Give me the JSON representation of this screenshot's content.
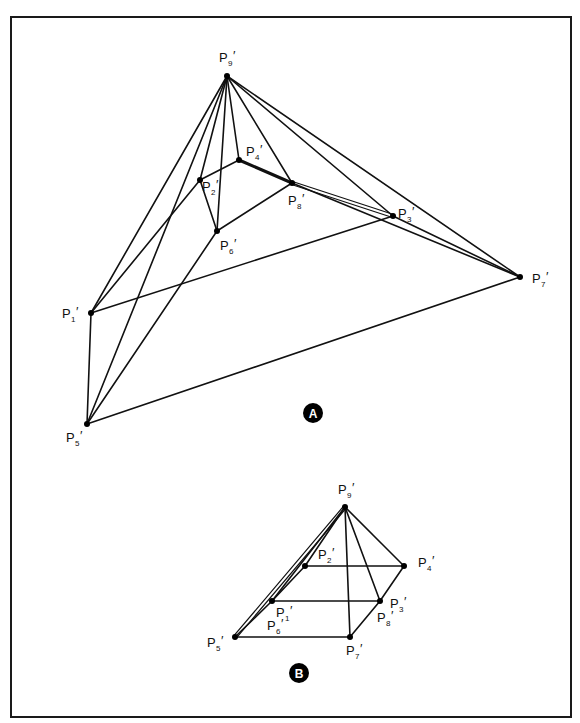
{
  "figure": {
    "frame": {
      "x": 11,
      "y": 17,
      "width": 560,
      "height": 700
    },
    "colors": {
      "line": "#111111",
      "vertex": "#000000",
      "badge": "#000000",
      "badge_text": "#ffffff",
      "background": "#ffffff"
    },
    "panels": [
      {
        "id": "A",
        "badge": {
          "label": "A",
          "x": 313,
          "y": 413,
          "r": 10
        },
        "points": [
          {
            "name": "P9",
            "label": "P",
            "sub": "9",
            "x": 227,
            "y": 76,
            "lx": 219,
            "ly": 62
          },
          {
            "name": "P4",
            "label": "P",
            "sub": "4",
            "x": 239,
            "y": 160,
            "lx": 246,
            "ly": 156
          },
          {
            "name": "P2",
            "label": "P",
            "sub": "2",
            "x": 200,
            "y": 180,
            "lx": 202,
            "ly": 191
          },
          {
            "name": "P8",
            "label": "P",
            "sub": "8",
            "x": 292,
            "y": 183,
            "lx": 288,
            "ly": 205
          },
          {
            "name": "P3",
            "label": "P",
            "sub": "3",
            "x": 393,
            "y": 216,
            "lx": 398,
            "ly": 218
          },
          {
            "name": "P6",
            "label": "P",
            "sub": "6",
            "x": 217,
            "y": 231,
            "lx": 220,
            "ly": 250
          },
          {
            "name": "P1",
            "label": "P",
            "sub": "1",
            "x": 91,
            "y": 313,
            "lx": 62,
            "ly": 318
          },
          {
            "name": "P5",
            "label": "P",
            "sub": "5",
            "x": 87,
            "y": 424,
            "lx": 66,
            "ly": 442
          },
          {
            "name": "P7",
            "label": "P",
            "sub": "7",
            "x": 520,
            "y": 277,
            "lx": 532,
            "ly": 283
          }
        ],
        "edges": [
          [
            "P9",
            "P1"
          ],
          [
            "P9",
            "P5"
          ],
          [
            "P9",
            "P2"
          ],
          [
            "P9",
            "P6"
          ],
          [
            "P9",
            "P4"
          ],
          [
            "P9",
            "P8"
          ],
          [
            "P9",
            "P3"
          ],
          [
            "P9",
            "P7"
          ],
          [
            "P1",
            "P2"
          ],
          [
            "P1",
            "P5"
          ],
          [
            "P1",
            "P3"
          ],
          [
            "P5",
            "P6"
          ],
          [
            "P5",
            "P7"
          ],
          [
            "P2",
            "P4"
          ],
          [
            "P2",
            "P6"
          ],
          [
            "P6",
            "P8"
          ],
          [
            "P8",
            "P7"
          ],
          [
            "P3",
            "P7"
          ]
        ],
        "thick_edges": [
          [
            "P4",
            "P8"
          ]
        ],
        "double_edges": [
          [
            "P8",
            "P3"
          ]
        ]
      },
      {
        "id": "B",
        "badge": {
          "label": "B",
          "x": 299,
          "y": 673,
          "r": 10
        },
        "points": [
          {
            "name": "P9",
            "label": "P",
            "sub": "9",
            "x": 345,
            "y": 507,
            "lx": 338,
            "ly": 494
          },
          {
            "name": "P2",
            "label": "P",
            "sub": "2",
            "x": 305,
            "y": 566,
            "lx": 318,
            "ly": 559
          },
          {
            "name": "P4",
            "label": "P",
            "sub": "4",
            "x": 404,
            "y": 566,
            "lx": 418,
            "ly": 567
          },
          {
            "name": "P1",
            "label": "P",
            "sub": "1",
            "x": 272,
            "y": 601,
            "lx": 276,
            "ly": 617
          },
          {
            "name": "P3",
            "label": "P",
            "sub": "3",
            "x": 380,
            "y": 601,
            "lx": 390,
            "ly": 608
          },
          {
            "name": "P5",
            "label": "P",
            "sub": "5",
            "x": 235,
            "y": 637,
            "lx": 207,
            "ly": 647
          },
          {
            "name": "P7",
            "label": "P",
            "sub": "7",
            "x": 350,
            "y": 637,
            "lx": 346,
            "ly": 655
          },
          {
            "name": "P6",
            "label": "P",
            "sub": "6",
            "x": 272,
            "y": 601,
            "lx": 267,
            "ly": 630
          },
          {
            "name": "P8",
            "label": "P",
            "sub": "8",
            "x": 380,
            "y": 601,
            "lx": 377,
            "ly": 622
          }
        ],
        "edges": [
          [
            "P9",
            "P1"
          ],
          [
            "P9",
            "P2"
          ],
          [
            "P9",
            "P7"
          ],
          [
            "P9",
            "P3"
          ],
          [
            "P9",
            "P4"
          ],
          [
            "P2",
            "P4"
          ],
          [
            "P1",
            "P3"
          ],
          [
            "P5",
            "P7"
          ],
          [
            "P2",
            "P1"
          ],
          [
            "P1",
            "P5"
          ],
          [
            "P4",
            "P3"
          ],
          [
            "P3",
            "P7"
          ]
        ],
        "thick_edges": [],
        "double_edges": [
          [
            "P9",
            "P5"
          ]
        ]
      }
    ]
  }
}
